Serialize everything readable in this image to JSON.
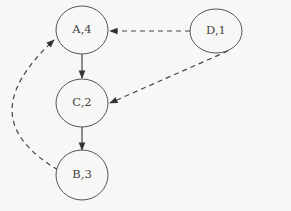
{
  "diagram": {
    "type": "directed-graph",
    "nodes": [
      {
        "id": "A",
        "label": "A,4",
        "cx": 82,
        "cy": 30
      },
      {
        "id": "C",
        "label": "C,2",
        "cx": 82,
        "cy": 103
      },
      {
        "id": "B",
        "label": "B,3",
        "cx": 82,
        "cy": 175
      },
      {
        "id": "D",
        "label": "D,1",
        "cx": 216,
        "cy": 31
      }
    ],
    "edges": [
      {
        "from": "A",
        "to": "C",
        "style": "solid"
      },
      {
        "from": "C",
        "to": "B",
        "style": "solid"
      },
      {
        "from": "D",
        "to": "A",
        "style": "dashed"
      },
      {
        "from": "D",
        "to": "C",
        "style": "dashed"
      },
      {
        "from": "B",
        "to": "A",
        "style": "dashed"
      }
    ]
  }
}
